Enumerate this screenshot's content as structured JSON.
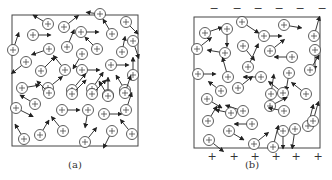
{
  "panels": [
    {
      "id": "a",
      "label": "(a)",
      "box": {
        "x": 12,
        "y": 15,
        "w": 126,
        "h": 131
      },
      "label_pos": {
        "x": 75,
        "y": 168
      },
      "top_signs": [],
      "bottom_signs": [],
      "ions": [
        {
          "x": 48,
          "y": 24,
          "dx": -10,
          "dy": -6
        },
        {
          "x": 100,
          "y": 14,
          "dx": -8,
          "dy": -1
        },
        {
          "x": 126,
          "y": 22,
          "dx": 8,
          "dy": 8
        },
        {
          "x": 33,
          "y": 35,
          "dx": 12,
          "dy": 0
        },
        {
          "x": 64,
          "y": 27,
          "dx": 10,
          "dy": -8
        },
        {
          "x": 81,
          "y": 32,
          "dx": 12,
          "dy": 0
        },
        {
          "x": 112,
          "y": 34,
          "dx": -6,
          "dy": -10
        },
        {
          "x": 13,
          "y": 50,
          "dx": 4,
          "dy": -12
        },
        {
          "x": 49,
          "y": 49,
          "dx": -12,
          "dy": 4
        },
        {
          "x": 67,
          "y": 47,
          "dx": 5,
          "dy": -12
        },
        {
          "x": 122,
          "y": 52,
          "dx": 2,
          "dy": -10
        },
        {
          "x": 133,
          "y": 41,
          "dx": 4,
          "dy": 12
        },
        {
          "x": 97,
          "y": 49,
          "dx": -8,
          "dy": -8
        },
        {
          "x": 26,
          "y": 62,
          "dx": -10,
          "dy": 8
        },
        {
          "x": 41,
          "y": 71,
          "dx": 10,
          "dy": -10
        },
        {
          "x": 65,
          "y": 70,
          "dx": -8,
          "dy": -10
        },
        {
          "x": 82,
          "y": 70,
          "dx": 12,
          "dy": 0
        },
        {
          "x": 82,
          "y": 54,
          "dx": -6,
          "dy": 10
        },
        {
          "x": 111,
          "y": 65,
          "dx": 12,
          "dy": 0
        },
        {
          "x": 133,
          "y": 75,
          "dx": 0,
          "dy": -12
        },
        {
          "x": 22,
          "y": 88,
          "dx": 12,
          "dy": -2
        },
        {
          "x": 48,
          "y": 88,
          "dx": 10,
          "dy": -8
        },
        {
          "x": 72,
          "y": 90,
          "dx": 10,
          "dy": -12
        },
        {
          "x": 92,
          "y": 89,
          "dx": 8,
          "dy": -12
        },
        {
          "x": 108,
          "y": 95,
          "dx": 0,
          "dy": -12
        },
        {
          "x": 125,
          "y": 90,
          "dx": -6,
          "dy": -10
        },
        {
          "x": 49,
          "y": 93,
          "dx": -8,
          "dy": -8
        },
        {
          "x": 72,
          "y": 94,
          "dx": 10,
          "dy": -10
        },
        {
          "x": 92,
          "y": 94,
          "dx": 10,
          "dy": -10
        },
        {
          "x": 108,
          "y": 96,
          "dx": -6,
          "dy": -10
        },
        {
          "x": 125,
          "y": 93,
          "dx": 4,
          "dy": -12
        },
        {
          "x": 16,
          "y": 108,
          "dx": 12,
          "dy": 6
        },
        {
          "x": 35,
          "y": 104,
          "dx": -10,
          "dy": -6
        },
        {
          "x": 62,
          "y": 110,
          "dx": 12,
          "dy": 0
        },
        {
          "x": 88,
          "y": 110,
          "dx": -2,
          "dy": 12
        },
        {
          "x": 104,
          "y": 114,
          "dx": 12,
          "dy": 0
        },
        {
          "x": 126,
          "y": 110,
          "dx": 4,
          "dy": -12
        },
        {
          "x": 24,
          "y": 139,
          "dx": -6,
          "dy": -10
        },
        {
          "x": 40,
          "y": 135,
          "dx": 6,
          "dy": -10
        },
        {
          "x": 63,
          "y": 131,
          "dx": -8,
          "dy": -10
        },
        {
          "x": 85,
          "y": 142,
          "dx": 8,
          "dy": -10
        },
        {
          "x": 112,
          "y": 131,
          "dx": -6,
          "dy": 12
        },
        {
          "x": 132,
          "y": 134,
          "dx": -8,
          "dy": -10
        }
      ]
    },
    {
      "id": "b",
      "label": "(b)",
      "box": {
        "x": 194,
        "y": 17,
        "w": 126,
        "h": 131
      },
      "label_pos": {
        "x": 252,
        "y": 168
      },
      "top_signs": [
        "−",
        "−",
        "−",
        "−",
        "−",
        "−"
      ],
      "top_signs_y": 12,
      "top_signs_x": [
        214,
        237,
        258,
        279,
        300,
        322
      ],
      "bottom_signs": [
        "+",
        "+",
        "+",
        "+",
        "+",
        "+"
      ],
      "bottom_signs_y": 160,
      "bottom_signs_x": [
        212,
        234,
        255,
        276,
        296,
        318
      ],
      "ions": [
        {
          "x": 242,
          "y": 22,
          "dx": 12,
          "dy": 8
        },
        {
          "x": 284,
          "y": 25,
          "dx": 12,
          "dy": 2
        },
        {
          "x": 205,
          "y": 33,
          "dx": 12,
          "dy": -4
        },
        {
          "x": 227,
          "y": 29,
          "dx": 0,
          "dy": 12
        },
        {
          "x": 264,
          "y": 36,
          "dx": 12,
          "dy": 0
        },
        {
          "x": 314,
          "y": 36,
          "dx": 4,
          "dy": -14
        },
        {
          "x": 197,
          "y": 49,
          "dx": 10,
          "dy": -8
        },
        {
          "x": 225,
          "y": 53,
          "dx": -12,
          "dy": -2
        },
        {
          "x": 243,
          "y": 46,
          "dx": 8,
          "dy": 10
        },
        {
          "x": 270,
          "y": 51,
          "dx": 10,
          "dy": -8
        },
        {
          "x": 292,
          "y": 57,
          "dx": -12,
          "dy": 0
        },
        {
          "x": 315,
          "y": 50,
          "dx": 0,
          "dy": 14
        },
        {
          "x": 198,
          "y": 74,
          "dx": 12,
          "dy": 0
        },
        {
          "x": 228,
          "y": 77,
          "dx": -4,
          "dy": -14
        },
        {
          "x": 248,
          "y": 67,
          "dx": 8,
          "dy": -18
        },
        {
          "x": 261,
          "y": 77,
          "dx": -12,
          "dy": 0
        },
        {
          "x": 289,
          "y": 73,
          "dx": -2,
          "dy": 12
        },
        {
          "x": 310,
          "y": 70,
          "dx": 6,
          "dy": -10
        },
        {
          "x": 221,
          "y": 91,
          "dx": -8,
          "dy": -6
        },
        {
          "x": 238,
          "y": 88,
          "dx": 10,
          "dy": -8
        },
        {
          "x": 271,
          "y": 94,
          "dx": 2,
          "dy": -14
        },
        {
          "x": 283,
          "y": 93,
          "dx": -10,
          "dy": -8
        },
        {
          "x": 306,
          "y": 94,
          "dx": -10,
          "dy": -8
        },
        {
          "x": 207,
          "y": 99,
          "dx": 10,
          "dy": 6
        },
        {
          "x": 243,
          "y": 111,
          "dx": -12,
          "dy": -4
        },
        {
          "x": 270,
          "y": 106,
          "dx": 12,
          "dy": -6
        },
        {
          "x": 284,
          "y": 111,
          "dx": -10,
          "dy": -2
        },
        {
          "x": 208,
          "y": 121,
          "dx": 6,
          "dy": -10
        },
        {
          "x": 231,
          "y": 113,
          "dx": -10,
          "dy": -2
        },
        {
          "x": 252,
          "y": 124,
          "dx": -12,
          "dy": 0
        },
        {
          "x": 283,
          "y": 131,
          "dx": 0,
          "dy": 12
        },
        {
          "x": 308,
          "y": 126,
          "dx": 4,
          "dy": -16
        },
        {
          "x": 209,
          "y": 140,
          "dx": 10,
          "dy": 8
        },
        {
          "x": 229,
          "y": 131,
          "dx": 10,
          "dy": 6
        },
        {
          "x": 254,
          "y": 144,
          "dx": 10,
          "dy": -8
        },
        {
          "x": 273,
          "y": 147,
          "dx": 4,
          "dy": -16
        },
        {
          "x": 295,
          "y": 129,
          "dx": -2,
          "dy": 14
        },
        {
          "x": 313,
          "y": 121,
          "dx": 4,
          "dy": -14
        }
      ]
    }
  ]
}
